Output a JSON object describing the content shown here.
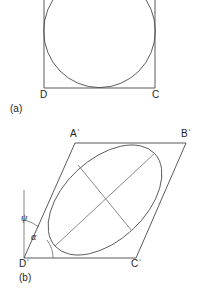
{
  "figure": {
    "caption_a": "(a)",
    "caption_b": "(b)",
    "panel_a": {
      "vertex_labels": {
        "bottom_left": "D",
        "bottom_right": "C"
      },
      "shapes": {
        "square": {
          "name": "square",
          "left": 44,
          "right": 155,
          "top": -26,
          "bottom": 88
        },
        "circle": {
          "name": "inscribed-circle",
          "cx": 99.5,
          "cy": 31,
          "r": 56
        }
      }
    },
    "panel_b": {
      "vertex_labels": {
        "top_left": "Aˈ",
        "top_right": "Bˈ",
        "bottom_left": "Dˈ",
        "bottom_right": "Cˈ"
      },
      "angle_labels": {
        "psi": "ψ",
        "alpha": "α"
      },
      "shapes": {
        "parallelogram": {
          "name": "parallelogram",
          "points": "75,143 186,143 136,258 24,258"
        },
        "ellipse": {
          "name": "inscribed-ellipse",
          "cx": 105,
          "cy": 200,
          "rx": 68,
          "ry": 40,
          "rotation_deg": -43
        },
        "major_axis": {
          "name": "major-axis",
          "x1": 55,
          "y1": 246,
          "x2": 155,
          "y2": 153
        },
        "minor_axis": {
          "name": "minor-axis",
          "x1": 78,
          "y1": 165,
          "x2": 132,
          "y2": 231
        },
        "vertical_reference": {
          "name": "vertical-reference-line",
          "x1": 24,
          "y1": 190,
          "x2": 24,
          "y2": 258
        },
        "psi_arc": {
          "name": "psi-angle-arc",
          "d": "M 24 222 A 36 36 0 0 1 37.5 228.5"
        },
        "alpha_arc": {
          "name": "alpha-angle-arc",
          "d": "M 52 258 A 28 28 0 0 0 46.5 240.5"
        }
      }
    }
  },
  "colors": {
    "stroke": "#3c3c3c",
    "stroke_light": "#6b6b6b",
    "conic": "#4a4a4a",
    "background": "#ffffff",
    "text": "#1d1d1d"
  }
}
